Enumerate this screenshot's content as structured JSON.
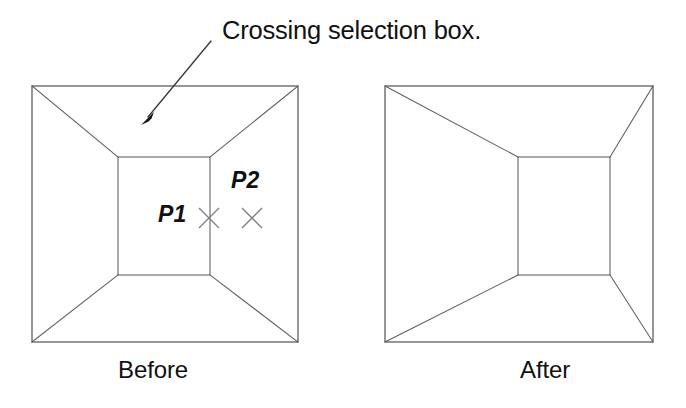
{
  "figure": {
    "background_color": "#ffffff",
    "line_color": "#5d5d5d",
    "text_color": "#111111",
    "mark_color": "#808080",
    "annotation": {
      "caption": "Crossing selection box.",
      "leader_from": [
        211,
        41
      ],
      "leader_to": [
        143,
        124
      ]
    },
    "panels": [
      {
        "id": "before",
        "caption": "Before",
        "outer_rect": {
          "x1": 32,
          "y1": 86,
          "x2": 298,
          "y2": 342
        },
        "inner_rect": {
          "x1": 118,
          "y1": 157,
          "x2": 210,
          "y2": 275
        },
        "diagonals": "corner-to-corner"
      },
      {
        "id": "after",
        "caption": "After",
        "outer_rect": {
          "x1": 385,
          "y1": 86,
          "x2": 653,
          "y2": 342
        },
        "inner_rect": {
          "x1": 518,
          "y1": 157,
          "x2": 610,
          "y2": 275
        },
        "diagonals": "corner-to-corner"
      }
    ],
    "points": [
      {
        "id": "p1",
        "label": "P1",
        "x": 209,
        "y": 218
      },
      {
        "id": "p2",
        "label": "P2",
        "x": 252,
        "y": 218
      }
    ]
  }
}
